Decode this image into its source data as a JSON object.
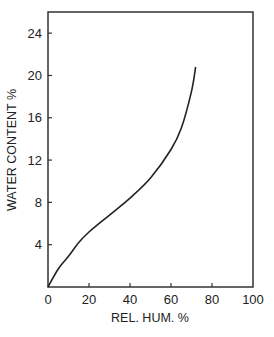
{
  "chart_data": {
    "type": "line",
    "title": "",
    "xlabel": "REL. HUM. %",
    "ylabel": "WATER CONTENT %",
    "xlim": [
      0,
      100
    ],
    "ylim": [
      0,
      26
    ],
    "grid": false,
    "legend": null,
    "xticks": [
      "0",
      "20",
      "40",
      "60",
      "80",
      "100"
    ],
    "yticks": [
      "4",
      "8",
      "12",
      "16",
      "20",
      "24"
    ],
    "series": [
      {
        "name": "sorption isotherm",
        "x": [
          0,
          5,
          10,
          15,
          20,
          30,
          40,
          50,
          60,
          65,
          70,
          72
        ],
        "y": [
          0,
          1.7,
          2.9,
          4.2,
          5.2,
          6.8,
          8.4,
          10.3,
          13.0,
          15.0,
          18.5,
          20.8
        ]
      }
    ],
    "colors": {
      "line": "#222222",
      "axis": "#333333"
    }
  }
}
